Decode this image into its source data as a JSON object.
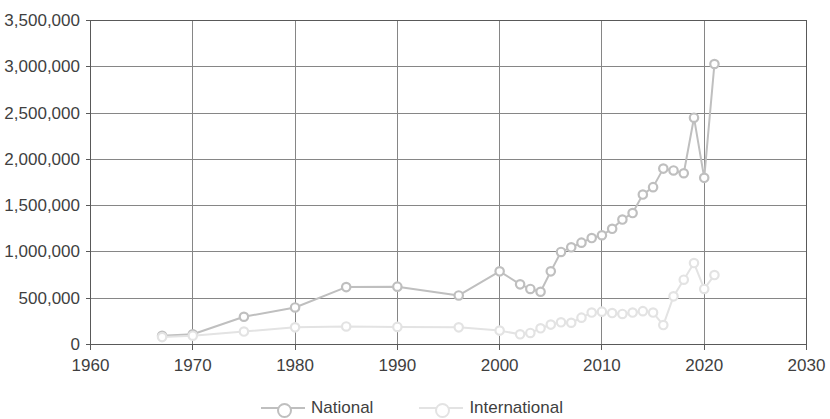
{
  "chart_data": {
    "type": "line",
    "title": "",
    "subtitle": "",
    "xlabel": "",
    "ylabel": "",
    "xlim": [
      1960,
      2030
    ],
    "ylim": [
      0,
      3500000
    ],
    "grid": true,
    "legend_position": "bottom",
    "x_ticks": [
      1960,
      1970,
      1980,
      1990,
      2000,
      2010,
      2020,
      2030
    ],
    "x_tick_labels": [
      "1960",
      "1970",
      "1980",
      "1990",
      "2000",
      "2010",
      "2020",
      "2030"
    ],
    "y_ticks": [
      0,
      500000,
      1000000,
      1500000,
      2000000,
      2500000,
      3000000,
      3500000
    ],
    "y_tick_labels": [
      "0",
      "500,000",
      "1,000,000",
      "1,500,000",
      "2,000,000",
      "2,500,000",
      "3,000,000",
      "3,500,000"
    ],
    "series": [
      {
        "name": "National",
        "color": "#bfbfbf",
        "marker": "circle",
        "x": [
          1967,
          1970,
          1975,
          1980,
          1985,
          1990,
          1996,
          2000,
          2002,
          2003,
          2004,
          2005,
          2006,
          2007,
          2008,
          2009,
          2010,
          2011,
          2012,
          2013,
          2014,
          2015,
          2016,
          2017,
          2018,
          2019,
          2020,
          2021
        ],
        "values": [
          95000,
          110000,
          300000,
          400000,
          620000,
          625000,
          530000,
          790000,
          650000,
          600000,
          570000,
          790000,
          1000000,
          1050000,
          1100000,
          1150000,
          1180000,
          1250000,
          1350000,
          1420000,
          1620000,
          1700000,
          1900000,
          1880000,
          1850000,
          2450000,
          1800000,
          3030000
        ]
      },
      {
        "name": "International",
        "color": "#e3e3e3",
        "marker": "circle",
        "x": [
          1967,
          1970,
          1975,
          1980,
          1985,
          1990,
          1996,
          2000,
          2002,
          2003,
          2004,
          2005,
          2006,
          2007,
          2008,
          2009,
          2010,
          2011,
          2012,
          2013,
          2014,
          2015,
          2016,
          2017,
          2018,
          2019,
          2020,
          2021
        ],
        "values": [
          80000,
          95000,
          140000,
          185000,
          195000,
          190000,
          185000,
          150000,
          110000,
          125000,
          175000,
          215000,
          240000,
          235000,
          290000,
          345000,
          355000,
          340000,
          330000,
          345000,
          360000,
          345000,
          210000,
          520000,
          700000,
          880000,
          600000,
          750000
        ]
      }
    ],
    "legend": [
      {
        "label": "National",
        "color": "#bfbfbf"
      },
      {
        "label": "International",
        "color": "#e3e3e3"
      }
    ],
    "axis_color": "#595959",
    "grid_color": "#868686",
    "plot_background": "#ffffff"
  }
}
